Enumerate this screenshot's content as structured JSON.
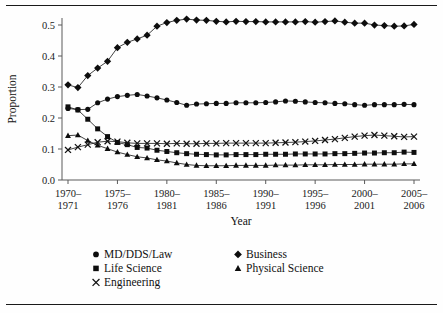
{
  "figure": {
    "has_top_rule": true,
    "has_bottom_rule": true,
    "background": "#ffffff",
    "ink": "#111111"
  },
  "chart_data": {
    "type": "line",
    "title": "",
    "xlabel": "Year",
    "ylabel": "Proportion",
    "grid": false,
    "legend_position": "bottom",
    "xlim": [
      1970,
      2005
    ],
    "ylim": [
      0.0,
      0.55
    ],
    "ytick_labels": [
      "0.0",
      "0.1",
      "0.2",
      "0.3",
      "0.4",
      "0.5"
    ],
    "ytick_values": [
      0.0,
      0.1,
      0.2,
      0.3,
      0.4,
      0.5
    ],
    "xtick_values": [
      1970,
      1975,
      1980,
      1985,
      1990,
      1995,
      2000,
      2005
    ],
    "xtick_labels": [
      {
        "line1": "1970–",
        "line2": "1971"
      },
      {
        "line1": "1975–",
        "line2": "1976"
      },
      {
        "line1": "1980–",
        "line2": "1981"
      },
      {
        "line1": "1985–",
        "line2": "1986"
      },
      {
        "line1": "1990–",
        "line2": "1991"
      },
      {
        "line1": "1995–",
        "line2": "1996"
      },
      {
        "line1": "2000–",
        "line2": "2001"
      },
      {
        "line1": "2005–",
        "line2": "2006"
      }
    ],
    "x": [
      1970,
      1971,
      1972,
      1973,
      1974,
      1975,
      1976,
      1977,
      1978,
      1979,
      1980,
      1981,
      1982,
      1983,
      1984,
      1985,
      1986,
      1987,
      1988,
      1989,
      1990,
      1991,
      1992,
      1993,
      1994,
      1995,
      1996,
      1997,
      1998,
      1999,
      2000,
      2001,
      2002,
      2003,
      2004,
      2005
    ],
    "series": [
      {
        "name": "Business",
        "marker": "diamond",
        "color": "#0d0d0d",
        "values": [
          0.307,
          0.298,
          0.337,
          0.361,
          0.383,
          0.427,
          0.444,
          0.455,
          0.467,
          0.496,
          0.508,
          0.515,
          0.519,
          0.516,
          0.515,
          0.512,
          0.51,
          0.512,
          0.511,
          0.511,
          0.51,
          0.51,
          0.51,
          0.51,
          0.511,
          0.509,
          0.511,
          0.513,
          0.509,
          0.506,
          0.506,
          0.5,
          0.498,
          0.496,
          0.497,
          0.502
        ]
      },
      {
        "name": "MD/DDS/Law",
        "marker": "circle",
        "color": "#0d0d0d",
        "values": [
          0.231,
          0.227,
          0.228,
          0.249,
          0.261,
          0.269,
          0.273,
          0.276,
          0.271,
          0.265,
          0.258,
          0.25,
          0.241,
          0.245,
          0.246,
          0.247,
          0.247,
          0.249,
          0.249,
          0.249,
          0.25,
          0.252,
          0.255,
          0.254,
          0.252,
          0.25,
          0.249,
          0.247,
          0.246,
          0.243,
          0.241,
          0.243,
          0.243,
          0.243,
          0.244,
          0.243
        ]
      },
      {
        "name": "Life Science",
        "marker": "square",
        "color": "#0d0d0d",
        "values": [
          0.236,
          0.226,
          0.196,
          0.165,
          0.14,
          0.121,
          0.114,
          0.105,
          0.103,
          0.096,
          0.092,
          0.088,
          0.085,
          0.083,
          0.082,
          0.081,
          0.081,
          0.082,
          0.082,
          0.082,
          0.083,
          0.083,
          0.083,
          0.084,
          0.084,
          0.084,
          0.084,
          0.085,
          0.085,
          0.086,
          0.087,
          0.087,
          0.088,
          0.088,
          0.09,
          0.089
        ]
      },
      {
        "name": "Physical Science",
        "marker": "triangle",
        "color": "#0d0d0d",
        "values": [
          0.143,
          0.145,
          0.127,
          0.112,
          0.101,
          0.09,
          0.082,
          0.075,
          0.071,
          0.065,
          0.061,
          0.055,
          0.05,
          0.047,
          0.046,
          0.046,
          0.046,
          0.047,
          0.047,
          0.047,
          0.047,
          0.048,
          0.048,
          0.048,
          0.049,
          0.049,
          0.049,
          0.05,
          0.05,
          0.05,
          0.051,
          0.051,
          0.051,
          0.051,
          0.052,
          0.052
        ]
      },
      {
        "name": "Engineering",
        "marker": "cross",
        "color": "#111111",
        "values": [
          0.097,
          0.106,
          0.114,
          0.122,
          0.125,
          0.124,
          0.12,
          0.118,
          0.118,
          0.118,
          0.117,
          0.118,
          0.117,
          0.117,
          0.118,
          0.118,
          0.119,
          0.119,
          0.119,
          0.119,
          0.119,
          0.12,
          0.121,
          0.122,
          0.124,
          0.126,
          0.129,
          0.132,
          0.136,
          0.14,
          0.143,
          0.145,
          0.143,
          0.141,
          0.139,
          0.14
        ]
      }
    ],
    "legend_entries": [
      {
        "label": "MD/DDS/Law",
        "marker": "circle",
        "col": 0,
        "row": 0
      },
      {
        "label": "Business",
        "marker": "diamond",
        "col": 1,
        "row": 0
      },
      {
        "label": "Life Science",
        "marker": "square",
        "col": 0,
        "row": 1
      },
      {
        "label": "Physical Science",
        "marker": "triangle",
        "col": 1,
        "row": 1
      },
      {
        "label": "Engineering",
        "marker": "cross",
        "col": 0,
        "row": 2
      }
    ]
  }
}
